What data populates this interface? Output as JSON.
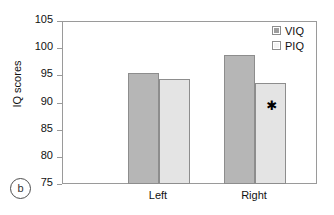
{
  "figure": {
    "panel_letter": "b",
    "ylabel": "IQ scores"
  },
  "legend": {
    "position": "top-right",
    "entries": [
      {
        "label": "VIQ",
        "color": "#b6b6b6",
        "swatch": "viq-swatch"
      },
      {
        "label": "PIQ",
        "color": "#e4e4e4",
        "swatch": "piq-swatch"
      }
    ]
  },
  "axis": {
    "y_ticks": [
      "105",
      "100",
      "95",
      "90",
      "85",
      "80",
      "75"
    ],
    "x_ticks": [
      "Left",
      "Right"
    ]
  },
  "annotations": {
    "significance_marker": "✱"
  },
  "chart_data": {
    "type": "bar",
    "title": "",
    "subtitle": "",
    "panel": "b",
    "xlabel": "",
    "ylabel": "IQ scores",
    "categories": [
      "Left",
      "Right"
    ],
    "series": [
      {
        "name": "VIQ",
        "values": [
          95.6,
          99.0
        ],
        "color": "#b6b6b6"
      },
      {
        "name": "PIQ",
        "values": [
          94.6,
          93.8
        ],
        "color": "#e4e4e4"
      }
    ],
    "ylim": [
      75,
      105
    ],
    "ytick_values": [
      105,
      100,
      95,
      90,
      85,
      80,
      75
    ],
    "ytick_labels": [
      "105",
      "100",
      "95",
      "90",
      "85",
      "80",
      "75"
    ],
    "grid": false,
    "legend_position": "top-right",
    "annotations": [
      {
        "text": "✱",
        "series": "PIQ",
        "category": "Right",
        "y": 90.0,
        "note": "significance marker"
      }
    ]
  }
}
